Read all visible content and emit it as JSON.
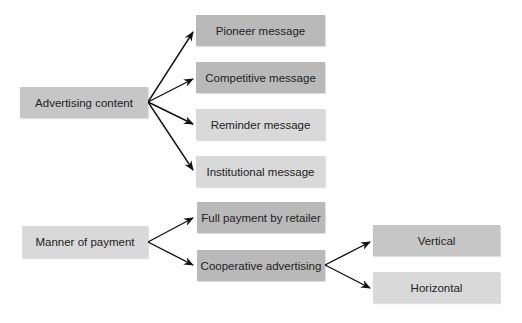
{
  "diagram": {
    "advertising": {
      "root": "Advertising content",
      "children": [
        "Pioneer message",
        "Competitive message",
        "Reminder message",
        "Institutional message"
      ]
    },
    "payment": {
      "root": "Manner of payment",
      "children": [
        "Full payment by retailer",
        "Cooperative advertising"
      ],
      "cooperative_children": [
        "Vertical",
        "Horizontal"
      ]
    }
  },
  "colors": {
    "dark": "#b9b9b9",
    "mid": "#c6c6c6",
    "light": "#d9d9d9",
    "arrow": "#111111"
  }
}
